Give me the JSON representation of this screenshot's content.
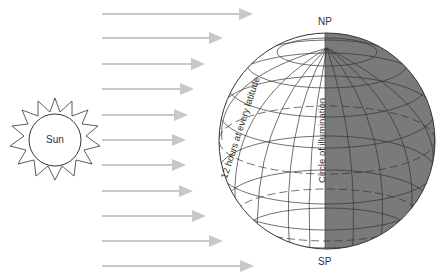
{
  "diagram": {
    "labels": {
      "sun": "Sun",
      "north_pole": "NP",
      "south_pole": "SP",
      "latitude_note": "12 hours at every latitude",
      "terminator": "Circle of illumination"
    },
    "colors": {
      "night_side": "#7a7a7a",
      "day_side": "#ffffff",
      "arrows": "#c8c8c8",
      "grid_lines": "#333333"
    },
    "sun_rays": [
      {
        "y": 14,
        "x_end": 255
      },
      {
        "y": 38,
        "x_end": 225
      },
      {
        "y": 64,
        "x_end": 207
      },
      {
        "y": 89,
        "x_end": 196
      },
      {
        "y": 115,
        "x_end": 190
      },
      {
        "y": 140,
        "x_end": 188
      },
      {
        "y": 165,
        "x_end": 188
      },
      {
        "y": 191,
        "x_end": 195
      },
      {
        "y": 216,
        "x_end": 208
      },
      {
        "y": 241,
        "x_end": 225
      },
      {
        "y": 266,
        "x_end": 256
      }
    ],
    "globe": {
      "cx": 327,
      "cy": 141,
      "r": 108
    }
  }
}
